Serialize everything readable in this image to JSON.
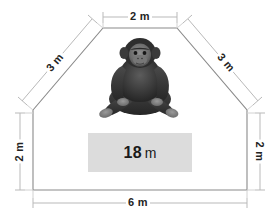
{
  "figure": {
    "kind": "geometry-diagram",
    "shape_name": "pentagon-enclosure",
    "outline_color": "#8a8a8a",
    "dimension_color": "#b4b4b4",
    "label_color": "#242424",
    "background": "#ffffff"
  },
  "dimensions": {
    "top": {
      "label": "2 m",
      "value": 2,
      "unit": "m",
      "edge": "top",
      "orientation": "horizontal"
    },
    "left_slant": {
      "label": "3 m",
      "value": 3,
      "unit": "m",
      "edge": "upper-left-slant",
      "orientation": "rotated"
    },
    "right_slant": {
      "label": "3 m",
      "value": 3,
      "unit": "m",
      "edge": "upper-right-slant",
      "orientation": "rotated"
    },
    "left_vertical": {
      "label": "2 m",
      "value": 2,
      "unit": "m",
      "edge": "left",
      "orientation": "vertical"
    },
    "right_vertical": {
      "label": "2 m",
      "value": 2,
      "unit": "m",
      "edge": "right",
      "orientation": "vertical"
    },
    "bottom": {
      "label": "6 m",
      "value": 6,
      "unit": "m",
      "edge": "bottom",
      "orientation": "horizontal"
    }
  },
  "area_callout": {
    "number": "18",
    "unit": "m",
    "full_label": "18 m",
    "background": "#dcdcdc"
  },
  "illustration": {
    "subject": "chimpanzee-icon",
    "description": "seated chimpanzee",
    "palette": [
      "#2b2b2b",
      "#4a4a4a",
      "#6d6d6d",
      "#8e8e8e"
    ]
  }
}
